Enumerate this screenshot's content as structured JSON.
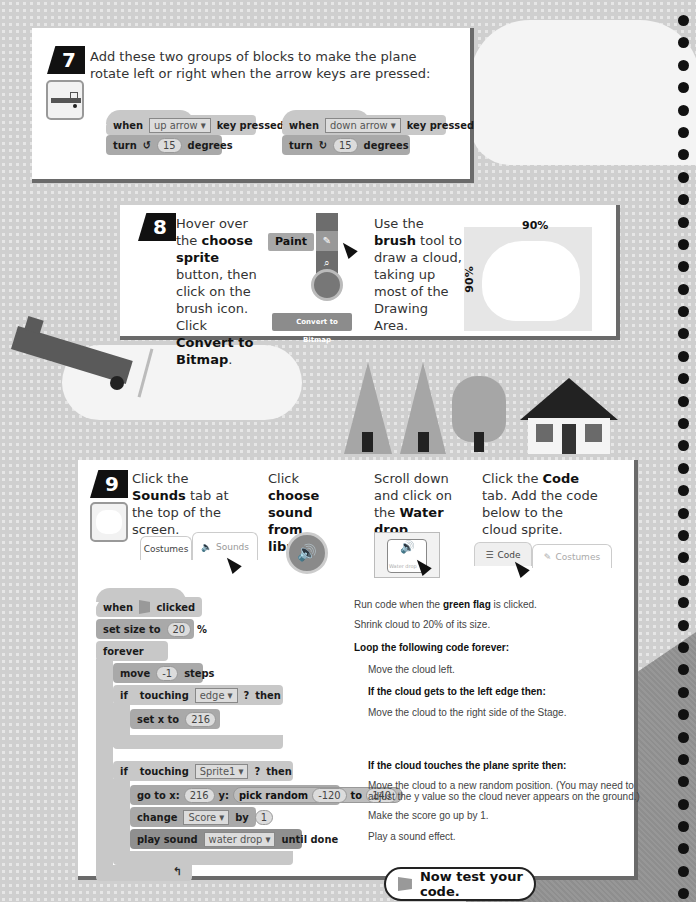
{
  "step7": {
    "number": "7",
    "text": "Add these two groups of blocks to make the plane rotate left or right when the arrow keys are pressed:",
    "groups": [
      {
        "when": "when",
        "key": "up arrow ▾",
        "pressed": "key pressed",
        "turn": "turn",
        "turn_icon": "↺",
        "degrees_value": "15",
        "degrees": "degrees"
      },
      {
        "when": "when",
        "key": "down arrow ▾",
        "pressed": "key pressed",
        "turn": "turn",
        "turn_icon": "↻",
        "degrees_value": "15",
        "degrees": "degrees"
      }
    ]
  },
  "step8": {
    "number": "8",
    "text_parts": [
      "Hover over the ",
      "choose sprite",
      " button, then click on the brush icon. Click ",
      "Convert to Bitmap",
      "."
    ],
    "paint_label": "Paint",
    "convert_button": "Convert to Bitmap",
    "brush_text_parts": [
      "Use the ",
      "brush",
      " tool to draw a cloud, taking up most of the Drawing Area."
    ],
    "width_pct": "90%",
    "height_pct": "90%"
  },
  "step9": {
    "number": "9",
    "col1_parts": [
      "Click the ",
      "Sounds",
      " tab at the top of the screen."
    ],
    "col2_parts": [
      "Click ",
      "choose sound from library",
      "."
    ],
    "col3_parts": [
      "Scroll down and click on the ",
      "Water drop",
      "."
    ],
    "col4_parts": [
      "Click the ",
      "Code",
      " tab. Add the code below to the cloud sprite."
    ],
    "tabs_a": {
      "costumes": "Costumes",
      "sounds": "Sounds"
    },
    "tabs_b": {
      "code": "Code",
      "costumes": "Costumes"
    },
    "water_drop_label": "Water drop",
    "code": {
      "when_clicked": {
        "when": "when",
        "clicked": "clicked"
      },
      "set_size": {
        "label": "set size to",
        "value": "20",
        "unit": "%"
      },
      "forever": "forever",
      "move": {
        "label": "move",
        "value": "-1",
        "unit": "steps"
      },
      "if1": {
        "if": "if",
        "touching": "touching",
        "target": "edge ▾",
        "q": "?",
        "then": "then"
      },
      "set_x": {
        "label": "set x to",
        "value": "216"
      },
      "if2": {
        "if": "if",
        "touching": "touching",
        "target": "Sprite1 ▾",
        "q": "?",
        "then": "then"
      },
      "goto": {
        "label": "go to x:",
        "x": "216",
        "y_label": "y:",
        "random": "pick random",
        "from": "-120",
        "to_label": "to",
        "to": "140"
      },
      "change": {
        "label": "change",
        "var": "Score ▾",
        "by": "by",
        "value": "1"
      },
      "play": {
        "label": "play sound",
        "sound": "water drop ▾",
        "until": "until done"
      }
    },
    "descriptions": {
      "d1_parts": [
        "Run code when the ",
        "green flag",
        " is clicked."
      ],
      "d2": "Shrink cloud to 20% of its size.",
      "d3": "Loop the following code forever:",
      "d4": "Move the cloud left.",
      "d5": "If the cloud gets to the left edge then:",
      "d6": "Move the cloud to the right side of the Stage.",
      "d7": "If the cloud touches the plane sprite then:",
      "d8a": "Move the cloud to a new random position. (You may need to",
      "d8b": "adjust the y value so the cloud never appears on the ground.)",
      "d9": "Make the score go up by 1.",
      "d10": "Play a sound effect."
    }
  },
  "test_button": "Now test your code."
}
